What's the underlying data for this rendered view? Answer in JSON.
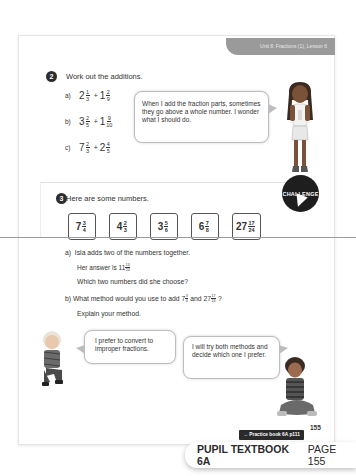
{
  "header": {
    "unit_label": "Unit 8: Fractions (1), Lesson 6"
  },
  "question2": {
    "number": "2",
    "prompt": "Work out the additions.",
    "items": [
      {
        "label": "a)",
        "w1": "2",
        "n1": "1",
        "d1": "3",
        "op": "+",
        "w2": "1",
        "n2": "2",
        "d2": "9"
      },
      {
        "label": "b)",
        "w1": "3",
        "n1": "2",
        "d1": "5",
        "op": "+",
        "w2": "1",
        "n2": "9",
        "d2": "10"
      },
      {
        "label": "c)",
        "w1": "7",
        "n1": "2",
        "d1": "3",
        "op": "+",
        "w2": "2",
        "n2": "4",
        "d2": "5"
      }
    ],
    "speech_bubble": "When I add the fraction parts, sometimes they go above a whole number. I wonder what I should do."
  },
  "question3": {
    "number": "3",
    "prompt": "Here are some numbers.",
    "badge": "CHALLENGE",
    "numbers": [
      {
        "w": "7",
        "n": "3",
        "d": "4"
      },
      {
        "w": "4",
        "n": "2",
        "d": "3"
      },
      {
        "w": "3",
        "n": "5",
        "d": "6"
      },
      {
        "w": "6",
        "n": "7",
        "d": "8"
      },
      {
        "w": "27",
        "n": "17",
        "d": "24"
      }
    ],
    "part_a": {
      "label": "a)",
      "line1": "Isla adds two of the numbers together.",
      "line2_prefix": "Her answer is",
      "answer": {
        "w": "11",
        "n": "13",
        "d": "24"
      },
      "line3": "Which two numbers did she choose?"
    },
    "part_b": {
      "label": "b)",
      "line1_prefix": "What method would you use to add",
      "num1": {
        "w": "7",
        "n": "3",
        "d": "4"
      },
      "and": "and",
      "num2": {
        "w": "27",
        "n": "17",
        "d": "24"
      },
      "q": "?",
      "line2": "Explain your method."
    },
    "bubble_left": "I prefer to convert to improper fractions.",
    "bubble_right": "I will try both methods and decide which one I prefer."
  },
  "footer": {
    "page_number": "155",
    "practice_link": "→ Practice book 6A p111",
    "banner_bold": "PUPIL TEXTBOOK 6A",
    "banner_page": "PAGE 155"
  }
}
